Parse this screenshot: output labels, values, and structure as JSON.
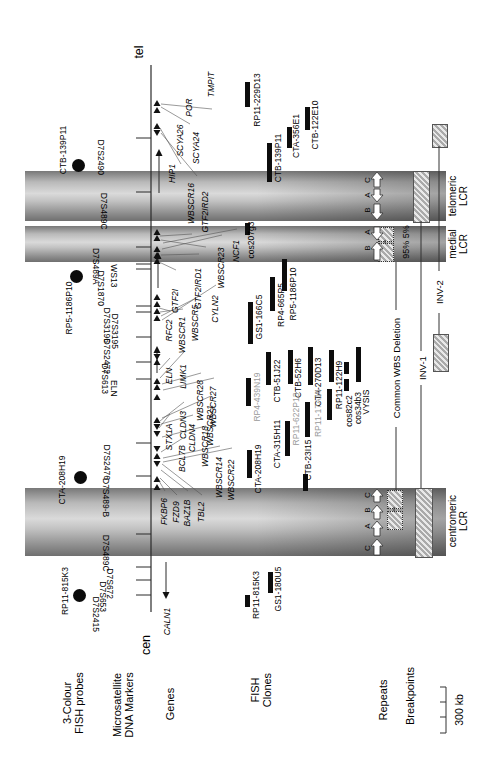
{
  "figure": {
    "tel": "tel",
    "cen": "cen",
    "axis": {
      "x": 151,
      "y1": 65,
      "y2": 612
    }
  },
  "rows": [
    {
      "label": "3-Colour\nFISH probes",
      "x": 74,
      "y": 703
    },
    {
      "label": "Microsatellite\nDNA Markers",
      "x": 124,
      "y": 705
    },
    {
      "label": "Genes",
      "x": 171,
      "y": 704
    },
    {
      "label": "FISH\nClones",
      "x": 262,
      "y": 690
    },
    {
      "label": "Repeats",
      "x": 384,
      "y": 700
    },
    {
      "label": "Breakpoints",
      "x": 411,
      "y": 696
    }
  ],
  "markers": [
    {
      "name": "D7S2490",
      "tick": 138,
      "lx": 100
    },
    {
      "name": "D7S489C",
      "tick": 192,
      "lx": 103
    },
    {
      "name": "D7S489A",
      "tick": 247,
      "lx": 95
    },
    {
      "name": "WS13",
      "tick": 264,
      "lx": 113
    },
    {
      "name": "D7S1870",
      "tick": 269,
      "lx": 100
    },
    {
      "name": "D7S3196",
      "tick": 306,
      "lx": 106
    },
    {
      "name": "D7S3195",
      "tick": 312,
      "lx": 114
    },
    {
      "name": "D7S2472",
      "tick": 337,
      "lx": 106
    },
    {
      "name": "D7S613",
      "tick": 362,
      "lx": 104
    },
    {
      "name": "ELN",
      "tick": 379,
      "lx": 113
    },
    {
      "name": "D7S2476",
      "tick": 443,
      "lx": 106
    },
    {
      "name": "D7S489-B",
      "tick": 476,
      "lx": 105
    },
    {
      "name": "D7S489C",
      "tick": 534,
      "lx": 105
    },
    {
      "name": "D7S672",
      "tick": 567,
      "lx": 109
    },
    {
      "name": "D7S653",
      "tick": 580,
      "lx": 102
    },
    {
      "name": "D7S2415",
      "tick": 595,
      "lx": 95
    }
  ],
  "genes": [
    {
      "name": "CALN1",
      "x": 168,
      "y1": 600,
      "y2": 643
    },
    {
      "name": "FKBP6",
      "x": 165,
      "y1": 493,
      "y2": 530,
      "from": [
        159,
        481
      ]
    },
    {
      "name": "FZD9",
      "x": 177,
      "y1": 497,
      "y2": 527,
      "from": [
        160,
        478
      ]
    },
    {
      "name": "BAZ1B",
      "x": 188,
      "y1": 493,
      "y2": 533,
      "from": [
        161,
        470
      ]
    },
    {
      "name": "TBL2",
      "x": 202,
      "y1": 497,
      "y2": 527,
      "from": [
        162,
        464
      ]
    },
    {
      "name": "BCL7B",
      "x": 183,
      "y1": 440,
      "y2": 477,
      "from": [
        161,
        452
      ]
    },
    {
      "name": "WBSCR14",
      "x": 220,
      "y1": 448,
      "y2": 507,
      "from": [
        163,
        458
      ]
    },
    {
      "name": "WBSCR22",
      "x": 232,
      "y1": 450,
      "y2": 510,
      "from": [
        163,
        462
      ]
    },
    {
      "name": "WBSCR18",
      "x": 206,
      "y1": 428,
      "y2": 465,
      "from": [
        162,
        437
      ]
    },
    {
      "name": "STX1A",
      "x": 170,
      "y1": 416,
      "y2": 458,
      "from": [
        159,
        428
      ]
    },
    {
      "name": "CLDN3",
      "x": 184,
      "y1": 404,
      "y2": 446,
      "from": [
        160,
        421
      ]
    },
    {
      "name": "CLDN4",
      "x": 193,
      "y1": 417,
      "y2": 459,
      "from": [
        161,
        424
      ]
    },
    {
      "name": "WBSCR21",
      "x": 211,
      "y1": 398,
      "y2": 453,
      "from": [
        162,
        418
      ]
    },
    {
      "name": "ELN",
      "x": 170,
      "y1": 360,
      "y2": 392,
      "from": [
        159,
        370
      ]
    },
    {
      "name": "LIMK1",
      "x": 184,
      "y1": 354,
      "y2": 399,
      "from": [
        160,
        378
      ]
    },
    {
      "name": "WBSCR28",
      "x": 201,
      "y1": 375,
      "y2": 426,
      "from": [
        162,
        384
      ]
    },
    {
      "name": "WBSCR27",
      "x": 214,
      "y1": 380,
      "y2": 434,
      "from": [
        163,
        390
      ]
    },
    {
      "name": "RFC2",
      "x": 170,
      "y1": 313,
      "y2": 348,
      "from": [
        159,
        308
      ]
    },
    {
      "name": "WBSCR1",
      "x": 183,
      "y1": 311,
      "y2": 359,
      "from": [
        160,
        312
      ]
    },
    {
      "name": "WBSCR5",
      "x": 196,
      "y1": 300,
      "y2": 346,
      "from": [
        161,
        316
      ]
    },
    {
      "name": "CYLN2",
      "x": 216,
      "y1": 287,
      "y2": 331,
      "from": [
        162,
        320
      ]
    },
    {
      "name": "GTF2I",
      "x": 176,
      "y1": 272,
      "y2": 330,
      "from": [
        159,
        262
      ]
    },
    {
      "name": "GTF2IRD1",
      "x": 199,
      "y1": 256,
      "y2": 321,
      "from": [
        161,
        255
      ]
    },
    {
      "name": "WBSCR23",
      "x": 222,
      "y1": 237,
      "y2": 299,
      "from": [
        162,
        249
      ]
    },
    {
      "name": "NCF1",
      "x": 237,
      "y1": 231,
      "y2": 271,
      "from": [
        163,
        243
      ]
    },
    {
      "name": "WBSCR16",
      "x": 192,
      "y1": 175,
      "y2": 232,
      "from": [
        160,
        236
      ],
      "att": "bot"
    },
    {
      "name": "GTF2IRD2",
      "x": 206,
      "y1": 179,
      "y2": 245,
      "from": [
        161,
        240
      ],
      "att": "bot"
    },
    {
      "name": "HIP1",
      "x": 173,
      "y1": 151,
      "y2": 196
    },
    {
      "name": "POR",
      "x": 190,
      "y1": 93,
      "y2": 122,
      "from": [
        161,
        107
      ],
      "att": "bot"
    },
    {
      "name": "SCYA26",
      "x": 181,
      "y1": 119,
      "y2": 162,
      "from": [
        160,
        128
      ],
      "att": "bot"
    },
    {
      "name": "SCYA24",
      "x": 197,
      "y1": 122,
      "y2": 174,
      "from": [
        161,
        133
      ],
      "att": "bot"
    },
    {
      "name": "TMPIT",
      "x": 212,
      "y1": 62,
      "y2": 107,
      "from": [
        161,
        104
      ],
      "att": "bot"
    }
  ],
  "gene_lines": [
    {
      "x": 159,
      "y1": 149,
      "y2": 197,
      "tip": "up"
    },
    {
      "x": 158,
      "y1": 252,
      "y2": 292,
      "tip": "up"
    },
    {
      "x": 157,
      "y1": 346,
      "y2": 377,
      "tip": "up"
    },
    {
      "x": 166,
      "y1": 558,
      "y2": 599,
      "tip": "down"
    }
  ],
  "triangles": [
    [
      103,
      1
    ],
    [
      110,
      1
    ],
    [
      126,
      1
    ],
    [
      133,
      -1
    ],
    [
      232,
      1
    ],
    [
      238,
      1
    ],
    [
      249,
      1
    ],
    [
      255,
      1
    ],
    [
      261,
      1
    ],
    [
      297,
      1
    ],
    [
      304,
      1
    ],
    [
      311,
      1
    ],
    [
      318,
      1
    ],
    [
      357,
      -1
    ],
    [
      362,
      1
    ],
    [
      381,
      1
    ],
    [
      387,
      1
    ],
    [
      397,
      1
    ],
    [
      420,
      1
    ],
    [
      427,
      -1
    ],
    [
      434,
      -1
    ],
    [
      449,
      -1
    ],
    [
      456,
      1
    ],
    [
      464,
      -1
    ],
    [
      479,
      1
    ],
    [
      487,
      1
    ]
  ],
  "clones": [
    {
      "name": "RP11-229D13",
      "bar": [
        247,
        82,
        107
      ],
      "label": [
        258,
        100
      ],
      "gray": false
    },
    {
      "name": "CTB-139P11",
      "bar": [
        269,
        143,
        182
      ],
      "label": [
        279,
        158
      ],
      "gray": false
    },
    {
      "name": "CTA-356E1",
      "bar": [
        289,
        127,
        148
      ],
      "label": [
        297,
        136
      ],
      "gray": false
    },
    {
      "name": "CTB-122E10",
      "bar": [
        307,
        107,
        130
      ],
      "label": [
        316,
        125
      ],
      "gray": false
    },
    {
      "name": "cos207g3",
      "bar": [
        247,
        223,
        235
      ],
      "label": [
        252,
        240
      ],
      "gray": false
    },
    {
      "name": "GS1-166C5",
      "bar": [
        250,
        302,
        344
      ],
      "label": [
        260,
        317
      ],
      "gray": false
    },
    {
      "name": "RP4-665P5",
      "bar": [
        272,
        277,
        311
      ],
      "label": [
        282,
        305
      ],
      "gray": false
    },
    {
      "name": "RP5-1186P10",
      "bar": [
        284,
        259,
        291
      ],
      "label": [
        294,
        294
      ],
      "gray": false
    },
    {
      "name": "RP4-439N19",
      "bar": [
        248,
        378,
        406
      ],
      "label": [
        258,
        397
      ],
      "gray": true
    },
    {
      "name": "CTB-51J22",
      "bar": [
        268,
        352,
        385
      ],
      "label": [
        278,
        381
      ],
      "gray": false
    },
    {
      "name": "CTB-52H6",
      "bar": [
        290,
        350,
        384
      ],
      "label": [
        299,
        378
      ],
      "gray": false
    },
    {
      "name": "CTA-270D13",
      "bar": [
        310,
        347,
        385
      ],
      "label": [
        319,
        382
      ],
      "gray": false
    },
    {
      "name": "RP11-122H9",
      "bar": [
        331,
        350,
        382
      ],
      "label": [
        340,
        385
      ],
      "gray": false
    },
    {
      "name": "cos82c2",
      "bar": [
        346,
        362,
        374
      ],
      "label": [
        350,
        411
      ],
      "gray": false
    },
    {
      "name": "cos34b3",
      "bar": [
        346,
        379,
        391
      ],
      "label": [
        359,
        408
      ],
      "gray": false
    },
    {
      "name": "VYSIS",
      "bar": [
        358,
        347,
        382
      ],
      "label": [
        367,
        402
      ],
      "gray": false
    },
    {
      "name": "CTB-23I15",
      "bar": [
        305,
        474,
        491
      ],
      "label": [
        309,
        460
      ],
      "gray": false
    },
    {
      "name": "CTA-208H19",
      "bar": [
        249,
        450,
        478
      ],
      "label": [
        259,
        469
      ],
      "gray": false
    },
    {
      "name": "CTA-315H11",
      "bar": [
        287,
        421,
        456
      ],
      "label": [
        278,
        444
      ],
      "gray": false
    },
    {
      "name": "RP11-622P13",
      "bar": [
        307,
        402,
        437
      ],
      "label": [
        297,
        419
      ],
      "gray": true
    },
    {
      "name": "RP11-17A14",
      "bar": [
        329,
        389,
        420
      ],
      "label": [
        319,
        413
      ],
      "gray": true
    },
    {
      "name": "RP11-815K3",
      "bar": [
        247,
        595,
        607
      ],
      "label": [
        257,
        595
      ],
      "gray": false
    },
    {
      "name": "GS1-180U5",
      "bar": [
        270,
        572,
        593
      ],
      "label": [
        279,
        589
      ],
      "gray": false
    }
  ],
  "probes": [
    {
      "name": "CTB-139P11",
      "dot": [
        78,
        165
      ],
      "label": [
        64,
        150
      ]
    },
    {
      "name": "RP5-1186P10",
      "dot": [
        76,
        276
      ],
      "label": [
        70,
        308
      ]
    },
    {
      "name": "CTA-208H19",
      "dot": [
        80,
        477
      ],
      "label": [
        63,
        480
      ]
    },
    {
      "name": "RP11-815K3",
      "dot": [
        79,
        595
      ],
      "label": [
        66,
        591
      ]
    }
  ],
  "bands": [
    {
      "name": "telomeric",
      "label": "telomeric\nLCR",
      "y1": 171,
      "y2": 221,
      "label_pos": [
        459,
        196
      ],
      "letters": [
        {
          "t": "C",
          "y": 180
        },
        {
          "t": "A",
          "y": 195
        },
        {
          "t": "B",
          "y": 210
        }
      ],
      "arrows": [
        [
          172,
          187,
          1
        ],
        [
          189,
          202,
          -1
        ],
        [
          204,
          220,
          -1
        ]
      ],
      "strip": [
        413,
        171,
        15,
        50
      ]
    },
    {
      "name": "medial",
      "label": "medial\nLCR",
      "y1": 226,
      "y2": 262,
      "label_pos": [
        459,
        244
      ],
      "letters": [
        {
          "t": "A",
          "y": 232
        },
        {
          "t": "B",
          "y": 248
        }
      ],
      "arrows": [
        [
          227,
          240,
          -1
        ],
        [
          242,
          260,
          1
        ]
      ]
    },
    {
      "name": "centromeric",
      "label": "centromeric\nLCR",
      "y1": 488,
      "y2": 556,
      "label_pos": [
        459,
        521
      ],
      "letters": [
        {
          "t": "C",
          "y": 495
        },
        {
          "t": "B",
          "y": 510
        },
        {
          "t": "A",
          "y": 526
        },
        {
          "t": "C",
          "y": 548
        }
      ],
      "arrows": [
        [
          489,
          502,
          1
        ],
        [
          505,
          519,
          1
        ],
        [
          521,
          536,
          1
        ],
        [
          539,
          555,
          1
        ]
      ],
      "strip": [
        415,
        488,
        16,
        68
      ]
    }
  ],
  "breakpoints": {
    "inv1": {
      "label": "INV-1",
      "pos": [
        423,
        368
      ],
      "x": 421,
      "segs": [
        [
          221,
          351
        ],
        [
          385,
          488
        ]
      ]
    },
    "inv2": {
      "label": "INV-2",
      "pos": [
        440,
        292
      ],
      "x": 439,
      "segs": [
        [
          146,
          271
        ],
        [
          313,
          334
        ]
      ],
      "boxes": [
        [
          432,
          124,
          14,
          22
        ],
        [
          433,
          334,
          14,
          36
        ]
      ]
    },
    "deletion": {
      "label": "Common WBS Deletion",
      "pos": [
        397,
        368
      ],
      "x": 396,
      "segs": [
        [
          262,
          310
        ],
        [
          427,
          490
        ]
      ],
      "squares": [
        [
          378,
          227,
          14,
          13
        ],
        [
          378,
          243,
          14,
          17
        ],
        [
          387,
          490,
          14,
          17
        ],
        [
          387,
          511,
          14,
          17
        ]
      ],
      "connectors": [
        [
          385,
          240,
          243
        ],
        [
          394,
          507,
          511
        ]
      ]
    },
    "pct": {
      "label": "95% 5%",
      "pos": [
        407,
        242
      ]
    }
  },
  "scale": {
    "label": "300 kb",
    "x": 446,
    "y1": 687,
    "y2": 733,
    "ticks": [
      687,
      702,
      717,
      733
    ],
    "label_pos": [
      460,
      710
    ]
  },
  "colors": {
    "axis": "#2b2b2b",
    "bar": "#0d0d0d",
    "gray_clone": "#9a9a9a",
    "leader": "#555555"
  }
}
